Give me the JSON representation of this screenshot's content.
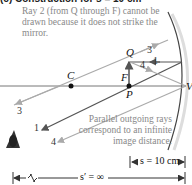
{
  "title": "(c) Construction for s = 10 cm",
  "notes": {
    "top": "Ray 2 (from Q through F) cannot be drawn because it does not strike the mirror.",
    "bottom": "Parallel outgoing rays correspond to an infinite image distance."
  },
  "points": {
    "center": "C",
    "focus": "F",
    "object_base": "P",
    "object_tip": "Q",
    "vertex": "V"
  },
  "ray_labels": [
    "1",
    "3",
    "4"
  ],
  "dimensions": {
    "object_distance": "s = 10 cm",
    "image_distance": "s′ = ∞"
  },
  "colors": {
    "ray_dark": "#555555",
    "ray_light": "#aaaaaa",
    "text_gray": "#888888",
    "axis": "#777777"
  }
}
